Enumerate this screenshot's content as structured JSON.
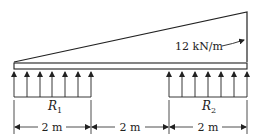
{
  "load": {
    "label": "12 kN/m",
    "type": "triangular distributed load"
  },
  "reactions": [
    {
      "label": "R",
      "sub": "1"
    },
    {
      "label": "R",
      "sub": "2"
    }
  ],
  "dimensions": [
    "2 m",
    "2 m",
    "2 m"
  ],
  "colors": {
    "line": "#222222",
    "beam_fill": "#ffffff"
  }
}
